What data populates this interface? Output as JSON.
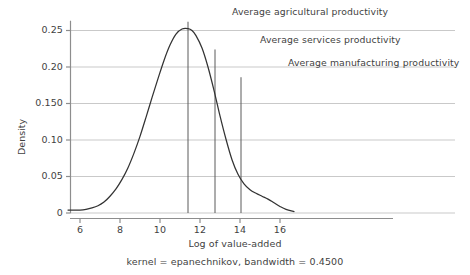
{
  "chart_data": {
    "type": "line",
    "title": "",
    "subtitle": "",
    "xlabel": "Log of value-added",
    "ylabel": "Density",
    "caption": "kernel = epanechnikov, bandwidth = 0.4500",
    "grid": true,
    "legend_position": "none",
    "xlim": [
      5.4,
      16.7
    ],
    "ylim": [
      0,
      0.262
    ],
    "xticks": [
      "6",
      "8",
      "10",
      "12",
      "14",
      "16"
    ],
    "xtick_values": [
      6,
      8,
      10,
      12,
      14,
      16
    ],
    "yticks": [
      "0",
      "0.05",
      "0.10",
      "0.150",
      "0.20",
      "0.25"
    ],
    "ytick_values": [
      0,
      0.05,
      0.1,
      0.15,
      0.2,
      0.25
    ],
    "series": [
      {
        "name": "Kernel density of log value-added",
        "x": [
          5.4,
          5.7,
          6.0,
          6.3,
          6.6,
          6.9,
          7.2,
          7.5,
          7.8,
          8.1,
          8.4,
          8.7,
          9.0,
          9.3,
          9.6,
          9.9,
          10.2,
          10.5,
          10.8,
          11.1,
          11.4,
          11.6,
          11.8,
          12.1,
          12.4,
          12.7,
          13.0,
          13.3,
          13.6,
          13.9,
          14.2,
          14.5,
          14.8,
          15.1,
          15.4,
          15.7,
          16.0,
          16.3,
          16.7
        ],
        "y": [
          0.004,
          0.004,
          0.004,
          0.005,
          0.007,
          0.01,
          0.015,
          0.023,
          0.033,
          0.046,
          0.062,
          0.082,
          0.105,
          0.131,
          0.158,
          0.184,
          0.209,
          0.23,
          0.245,
          0.252,
          0.2525,
          0.25,
          0.243,
          0.226,
          0.2,
          0.168,
          0.133,
          0.101,
          0.073,
          0.053,
          0.04,
          0.032,
          0.027,
          0.023,
          0.019,
          0.014,
          0.009,
          0.005,
          0.002
        ]
      }
    ],
    "annotations": [
      {
        "id": "agricultural",
        "label": "Average agricultural productivity",
        "x_value": 11.4,
        "rule_top_density": 0.262,
        "label_x": 232,
        "label_y": 6
      },
      {
        "id": "services",
        "label": "Average services productivity",
        "x_value": 12.75,
        "rule_top_density": 0.224,
        "label_x": 260,
        "label_y": 34
      },
      {
        "id": "manufacturing",
        "label": "Average manufacturing productivity",
        "x_value": 14.05,
        "rule_top_density": 0.186,
        "label_x": 288,
        "label_y": 57
      }
    ],
    "colors": {
      "curve": "#333333",
      "grid": "#c9c9c9",
      "axis": "#8d8d8d",
      "annotation_rule": "#5a5a5a",
      "text": "#3f3f3f",
      "background": "#ffffff"
    }
  }
}
